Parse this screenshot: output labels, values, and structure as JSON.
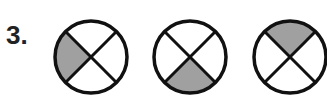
{
  "problem": {
    "number_label": "3."
  },
  "figures": {
    "shade_color": "#a0a0a0",
    "stroke_color": "#111111",
    "items": [
      {
        "name": "circle-1",
        "cx": 91,
        "cy": 57,
        "r": 36,
        "shaded_quadrant": "left"
      },
      {
        "name": "circle-2",
        "cx": 190,
        "cy": 57,
        "r": 36,
        "shaded_quadrant": "bottom"
      },
      {
        "name": "circle-3",
        "cx": 290,
        "cy": 57,
        "r": 36,
        "shaded_quadrant": "top"
      }
    ]
  }
}
